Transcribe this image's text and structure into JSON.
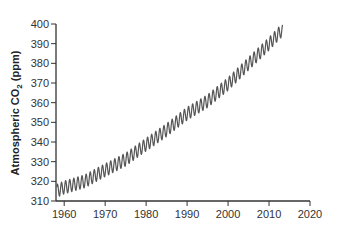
{
  "chart_data": {
    "type": "line",
    "title": "",
    "xlabel": "",
    "ylabel": "Atmospheric CO2 (ppm)",
    "ylabel_main": "Atmospheric CO",
    "ylabel_sub": "2",
    "ylabel_unit": " (ppm)",
    "xlim": [
      1958,
      2020
    ],
    "ylim": [
      310,
      400
    ],
    "xticks": [
      1960,
      1970,
      1980,
      1990,
      2000,
      2010,
      2020
    ],
    "yticks": [
      310,
      320,
      330,
      340,
      350,
      360,
      370,
      380,
      390,
      400
    ],
    "grid": false,
    "legend": "none",
    "series": [
      {
        "name": "Mauna Loa CO2 (monthly)",
        "color": "#555555",
        "start_year": 1958.2,
        "end_year": 2013.3,
        "trend_points": [
          [
            1958,
            315
          ],
          [
            1960,
            316.9
          ],
          [
            1965,
            320
          ],
          [
            1970,
            325.7
          ],
          [
            1975,
            331.1
          ],
          [
            1980,
            338.7
          ],
          [
            1985,
            346.1
          ],
          [
            1990,
            354.4
          ],
          [
            1995,
            360.8
          ],
          [
            2000,
            369.5
          ],
          [
            2005,
            379.8
          ],
          [
            2010,
            389.9
          ],
          [
            2013,
            396.5
          ]
        ],
        "seasonal_amplitude_ppm": 3.3
      }
    ]
  }
}
